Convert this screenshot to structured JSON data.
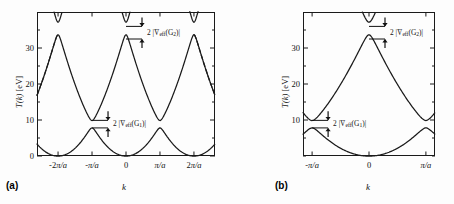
{
  "figure": {
    "caption_a": "(a)",
    "caption_b": "(b)",
    "background": "#fdfdfd",
    "curve_color": "#1a1a1a"
  },
  "chart_data": [
    {
      "type": "line",
      "panel": "(a)",
      "title": "",
      "scheme": "extended zone scheme",
      "xlabel": "k",
      "ylabel": "T(k) [eV]",
      "xlim": [
        -2.62,
        2.62
      ],
      "ylim": [
        0,
        40
      ],
      "xtick_values": [
        -2,
        -1,
        0,
        1,
        2
      ],
      "xtick_labels": [
        "-2π/a",
        "-π/a",
        "0",
        "π/a",
        "2π/a"
      ],
      "ytick_values": [
        0,
        10,
        20,
        30
      ],
      "ytick_labels": [
        "0",
        "10",
        "20",
        "30"
      ],
      "yminor_values": [
        5,
        15,
        25,
        35
      ],
      "grid": false,
      "legend": "none",
      "gap_energies_ev": {
        "G1_lower_top": 7.8,
        "G1_upper_bottom": 9.9,
        "G2_lower_top": 32.5,
        "G2_upper_bottom": 36.0
      },
      "annotations": [
        {
          "name": "gap-label-g2",
          "text": "2 |V̄",
          "sub": "eff",
          "tail": "(G",
          "sub2": "2",
          "tail2": ")|"
        },
        {
          "name": "gap-label-g1",
          "text": "2 |V̄",
          "sub": "eff",
          "tail": "(G",
          "sub2": "1",
          "tail2": ")|"
        }
      ],
      "series": [
        {
          "name": "band-1-lower",
          "style": "solid",
          "description": "lowest band, maxima 7.8 eV at ±π/a, minima 0 eV at 0 and ±2π/a"
        },
        {
          "name": "band-2-upper",
          "style": "solid",
          "description": "second band, minima 9.9 eV at ±π/a, maxima 32.5 eV at 0 and ±2π/a"
        },
        {
          "name": "band-3-top",
          "style": "solid",
          "description": "third band, minima 36.0 eV at 0 and ±2π/a, rising off-scale"
        },
        {
          "name": "band-2-dashed-left",
          "style": "dashed",
          "description": "dashed continuation of second band left of -2π/a"
        },
        {
          "name": "band-2-dashed-right",
          "style": "dashed",
          "description": "dashed continuation of second band right of 2π/a"
        }
      ]
    },
    {
      "type": "line",
      "panel": "(b)",
      "title": "",
      "scheme": "reduced zone scheme",
      "xlabel": "k",
      "ylabel": "T(k) [eV]",
      "xlim": [
        -1.16,
        1.16
      ],
      "ylim": [
        0,
        40
      ],
      "xtick_values": [
        -1,
        0,
        1
      ],
      "xtick_labels": [
        "-π/a",
        "0",
        "π/a"
      ],
      "ytick_values": [
        10,
        20,
        30
      ],
      "ytick_labels": [
        "10",
        "20",
        "30"
      ],
      "yminor_values": [
        0,
        5,
        15,
        25,
        35
      ],
      "grid": false,
      "legend": "none",
      "gap_energies_ev": {
        "G1_lower_top": 7.8,
        "G1_upper_bottom": 9.9,
        "G2_lower_top": 32.5,
        "G2_upper_bottom": 36.0
      },
      "annotations": [
        {
          "name": "gap-label-g2",
          "text": "2 |V̄",
          "sub": "eff",
          "tail": "(G",
          "sub2": "2",
          "tail2": ")|"
        },
        {
          "name": "gap-label-g1",
          "text": "2 |V̄",
          "sub": "eff",
          "tail": "(G",
          "sub2": "1",
          "tail2": ")|"
        }
      ],
      "series": [
        {
          "name": "band-1-lower",
          "style": "solid",
          "description": "lowest band, minimum 0 eV at k=0, maxima 7.8 eV at ±π/a"
        },
        {
          "name": "band-2-upper",
          "style": "solid",
          "description": "second band, maximum 32.5 eV at k=0, minima 9.9 eV at ±π/a"
        },
        {
          "name": "band-3-top",
          "style": "solid",
          "description": "third band, minimum 36.0 eV at k=0, rising to frame edges"
        }
      ]
    }
  ],
  "panel_a": {
    "caption": "(a)",
    "ylabel_parts": {
      "italic": "T(k)",
      "rest": " [eV]"
    },
    "ylabel_full": "T(k) [eV]",
    "xlabel": "k",
    "xticks": [
      "-2π/a",
      "-π/a",
      "0",
      "π/a",
      "2π/a"
    ],
    "yticks": [
      "30",
      "20",
      "10",
      "0"
    ],
    "gap_label_g1": "2 |V̄eff(G1)|",
    "gap_label_g2": "2 |V̄eff(G2)|"
  },
  "panel_b": {
    "caption": "(b)",
    "ylabel_full": "T(k) [eV]",
    "xlabel": "k",
    "xticks": [
      "-π/a",
      "0",
      "π/a"
    ],
    "yticks": [
      "30",
      "20",
      "10"
    ],
    "gap_label_g1": "2 |V̄eff(G1)|",
    "gap_label_g2": "2 |V̄eff(G2)|"
  }
}
